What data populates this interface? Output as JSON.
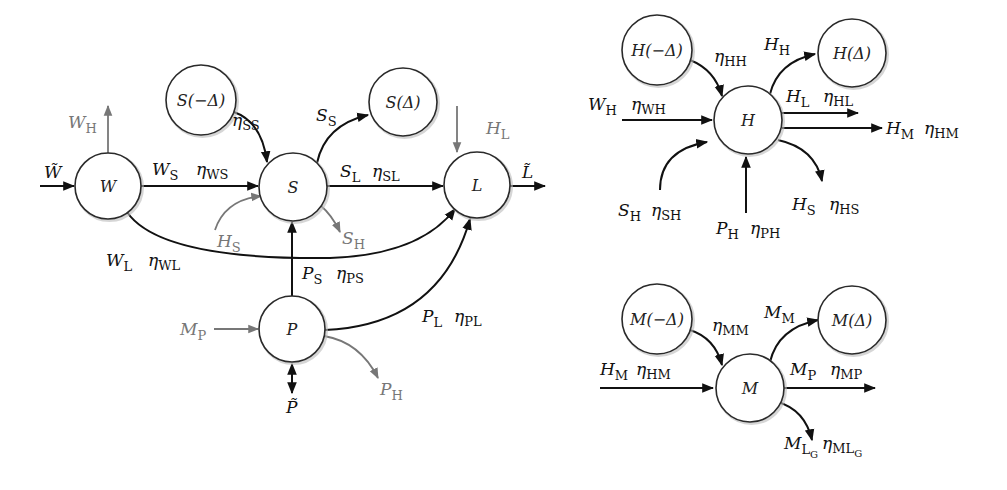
{
  "diagram": {
    "type": "flow-network",
    "panels": [
      "main",
      "H-subsystem",
      "M-subsystem"
    ],
    "nodes": [
      {
        "id": "W",
        "label": "W",
        "x": 108,
        "y": 186,
        "r": 33
      },
      {
        "id": "S-minus",
        "label": "S(−Δ)",
        "x": 201,
        "y": 100,
        "r": 35
      },
      {
        "id": "S",
        "label": "S",
        "x": 293,
        "y": 187,
        "r": 34
      },
      {
        "id": "S-plus",
        "label": "S(Δ)",
        "x": 403,
        "y": 102,
        "r": 34
      },
      {
        "id": "L",
        "label": "L",
        "x": 477,
        "y": 185,
        "r": 33
      },
      {
        "id": "P",
        "label": "P",
        "x": 292,
        "y": 329,
        "r": 33
      },
      {
        "id": "H-minus",
        "label": "H(−Δ)",
        "x": 657,
        "y": 50,
        "r": 35
      },
      {
        "id": "H",
        "label": "H",
        "x": 748,
        "y": 120,
        "r": 34
      },
      {
        "id": "H-plus",
        "label": "H(Δ)",
        "x": 852,
        "y": 53,
        "r": 34
      },
      {
        "id": "M-minus",
        "label": "M(−Δ)",
        "x": 657,
        "y": 319,
        "r": 35
      },
      {
        "id": "M",
        "label": "M",
        "x": 750,
        "y": 388,
        "r": 34
      },
      {
        "id": "M-plus",
        "label": "M(Δ)",
        "x": 852,
        "y": 320,
        "r": 34
      }
    ],
    "labels": {
      "W_tilde": {
        "base": "W̃",
        "sub": ""
      },
      "W_H": {
        "base": "W",
        "sub": "H"
      },
      "W_S": {
        "base": "W",
        "sub": "S"
      },
      "eta_WS": {
        "base": "η",
        "sub": "WS"
      },
      "eta_SS": {
        "base": "η",
        "sub": "SS"
      },
      "S_S": {
        "base": "S",
        "sub": "S"
      },
      "S_L": {
        "base": "S",
        "sub": "L"
      },
      "eta_SL": {
        "base": "η",
        "sub": "SL"
      },
      "H_L": {
        "base": "H",
        "sub": "L"
      },
      "L_tilde": {
        "base": "L̃",
        "sub": ""
      },
      "H_S_main": {
        "base": "H",
        "sub": "S"
      },
      "S_H_main": {
        "base": "S",
        "sub": "H"
      },
      "W_L": {
        "base": "W",
        "sub": "L"
      },
      "eta_WL": {
        "base": "η",
        "sub": "WL"
      },
      "P_S": {
        "base": "P",
        "sub": "S"
      },
      "eta_PS": {
        "base": "η",
        "sub": "PS"
      },
      "P_L": {
        "base": "P",
        "sub": "L"
      },
      "eta_PL": {
        "base": "η",
        "sub": "PL"
      },
      "M_P_main": {
        "base": "M",
        "sub": "P"
      },
      "P_H_main": {
        "base": "P",
        "sub": "H"
      },
      "P_tilde": {
        "base": "P̃",
        "sub": ""
      },
      "eta_HH": {
        "base": "η",
        "sub": "HH"
      },
      "W_H_h": {
        "base": "W",
        "sub": "H"
      },
      "eta_WH": {
        "base": "η",
        "sub": "WH"
      },
      "H_H": {
        "base": "H",
        "sub": "H"
      },
      "H_L_h": {
        "base": "H",
        "sub": "L"
      },
      "eta_HL": {
        "base": "η",
        "sub": "HL"
      },
      "H_M_h": {
        "base": "H",
        "sub": "M"
      },
      "eta_HM_h": {
        "base": "η",
        "sub": "HM"
      },
      "S_H_h": {
        "base": "S",
        "sub": "H"
      },
      "eta_SH": {
        "base": "η",
        "sub": "SH"
      },
      "P_H_h": {
        "base": "P",
        "sub": "H"
      },
      "eta_PH": {
        "base": "η",
        "sub": "PH"
      },
      "H_S_h": {
        "base": "H",
        "sub": "S"
      },
      "eta_HS": {
        "base": "η",
        "sub": "HS"
      },
      "eta_MM": {
        "base": "η",
        "sub": "MM"
      },
      "M_M": {
        "base": "M",
        "sub": "M"
      },
      "H_M_m": {
        "base": "H",
        "sub": "M"
      },
      "eta_HM_m": {
        "base": "η",
        "sub": "HM"
      },
      "M_P_m": {
        "base": "M",
        "sub": "P"
      },
      "eta_MP": {
        "base": "η",
        "sub": "MP"
      },
      "M_LG": {
        "base": "M",
        "sub": "L",
        "subsub": "G"
      },
      "eta_MLG": {
        "base": "η",
        "sub": "ML",
        "subsub": "G"
      }
    }
  }
}
